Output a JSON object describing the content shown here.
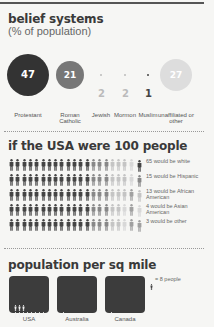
{
  "belief": {
    "title": "belief systems",
    "subtitle": "(% of population)",
    "groups": [
      {
        "label": "Protestant",
        "value": "47",
        "color": "#333333"
      },
      {
        "label": "Roman Catholic",
        "value": "21",
        "color": "#777777"
      },
      {
        "label": "Jewish",
        "value": "2",
        "color": "#bbbbbb"
      },
      {
        "label": "Mormon",
        "value": "2",
        "color": "#bbbbbb"
      },
      {
        "label": "Muslim",
        "value": "1",
        "color": "#444444"
      },
      {
        "label": "unaffiliated or other",
        "value": "27",
        "color": "#dddddd"
      }
    ]
  },
  "people": {
    "title": "if the USA were 100 people",
    "groups": [
      {
        "count": 65,
        "label": "65 would be white",
        "color": "#444444"
      },
      {
        "count": 15,
        "label": "15 would be Hispanic",
        "color": "#888888"
      },
      {
        "count": 13,
        "label": "13 would be African American",
        "color": "#c4c4c4"
      },
      {
        "count": 4,
        "label": "4 would be Asian American",
        "color": "#d8d8d8"
      },
      {
        "count": 3,
        "label": "3 would be other",
        "color": "#a0a0a0"
      }
    ]
  },
  "density": {
    "title": "population per sq mile",
    "legend": "= 8 people",
    "countries": [
      {
        "label": "USA",
        "figures": 11
      },
      {
        "label": "Australia",
        "figures": 1
      },
      {
        "label": "Canada",
        "figures": 1
      }
    ]
  },
  "chart_data": [
    {
      "type": "bubble",
      "title": "belief systems",
      "subtitle": "(% of population)",
      "categories": [
        "Protestant",
        "Roman Catholic",
        "Jewish",
        "Mormon",
        "Muslim",
        "unaffiliated or other"
      ],
      "values": [
        47,
        21,
        2,
        2,
        1,
        27
      ]
    },
    {
      "type": "pictogram",
      "title": "if the USA were 100 people",
      "categories": [
        "white",
        "Hispanic",
        "African American",
        "Asian American",
        "other"
      ],
      "values": [
        65,
        15,
        13,
        4,
        3
      ]
    },
    {
      "type": "pictogram",
      "title": "population per sq mile",
      "unit": "1 figure = 8 people",
      "categories": [
        "USA",
        "Australia",
        "Canada"
      ],
      "values": [
        11,
        1,
        1
      ]
    }
  ]
}
